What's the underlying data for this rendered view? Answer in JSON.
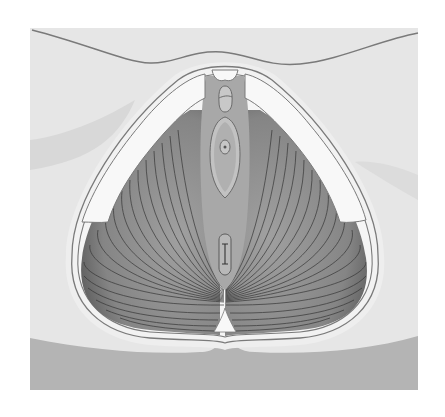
{
  "diagram": {
    "type": "anatomical-illustration",
    "labels": [],
    "colors": {
      "background": "#ffffff",
      "skin_light": "#e6e6e6",
      "skin_shadow": "#d6d6d6",
      "buttock_dark": "#b4b4b4",
      "outline": "#7a7a7a",
      "bone_white": "#f8f8f8",
      "ring_light": "#ececec",
      "muscle_mid": "#8e8e8e",
      "muscle_dark": "#5a5a5a",
      "fiber_line": "#3a3a3a",
      "urogenital_gray": "#a8a8a8",
      "vestibule_light": "#c2c2c2"
    }
  }
}
